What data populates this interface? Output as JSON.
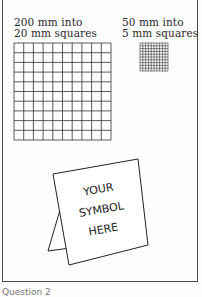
{
  "figure": {
    "large_grid": {
      "label_line1": "200 mm into",
      "label_line2": "20 mm squares",
      "divisions": 10
    },
    "small_grid": {
      "label_line1": "50 mm into",
      "label_line2": "5 mm squares",
      "divisions": 10
    },
    "card": {
      "line1": "YOUR",
      "line2": "SYMBOL",
      "line3": "HERE"
    },
    "caption": "Question 2"
  },
  "colors": {
    "ink": "#2a2a2a",
    "background": "#fdfdfd"
  }
}
